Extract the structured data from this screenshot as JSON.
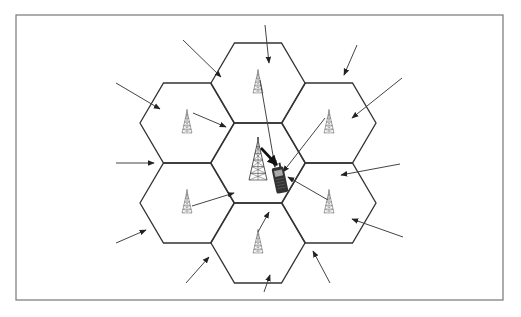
{
  "diagram": {
    "type": "cellular-network-cochannel-interference",
    "frame": {
      "x": 16,
      "y": 15,
      "width": 487,
      "height": 285,
      "stroke": "#777777"
    },
    "colors": {
      "hex_stroke": "#333333",
      "arrow": "#444444",
      "tower": "#555555",
      "phone": "#333333",
      "background": "#ffffff"
    },
    "cells": [
      {
        "id": "center",
        "cx": 258,
        "cy": 163,
        "has_tower": true,
        "tower_size": "large"
      },
      {
        "id": "top",
        "cx": 258,
        "cy": 83,
        "has_tower": true,
        "tower_size": "small"
      },
      {
        "id": "upper-left",
        "cx": 187,
        "cy": 123,
        "has_tower": true,
        "tower_size": "small"
      },
      {
        "id": "upper-right",
        "cx": 329,
        "cy": 123,
        "has_tower": true,
        "tower_size": "small"
      },
      {
        "id": "lower-left",
        "cx": 187,
        "cy": 203,
        "has_tower": true,
        "tower_size": "small"
      },
      {
        "id": "lower-right",
        "cx": 329,
        "cy": 203,
        "has_tower": true,
        "tower_size": "small"
      },
      {
        "id": "bottom",
        "cx": 258,
        "cy": 243,
        "has_tower": true,
        "tower_size": "small"
      }
    ],
    "hex_radius": 47,
    "mobile_phone": {
      "x": 274,
      "y": 167,
      "width": 12,
      "height": 26
    },
    "serving_link": {
      "from": [
        261,
        148
      ],
      "to": [
        277,
        165
      ],
      "style": "bold"
    },
    "interference_arrows_to_phone": [
      {
        "from_cell": "top",
        "from": [
          260,
          80
        ],
        "to": [
          275,
          167
        ]
      },
      {
        "from_cell": "upper-left",
        "from": [
          193,
          113
        ],
        "to": [
          226,
          127
        ]
      },
      {
        "from_cell": "upper-right",
        "from": [
          325,
          118
        ],
        "to": [
          283,
          172
        ]
      },
      {
        "from_cell": "lower-left",
        "from": [
          192,
          206
        ],
        "to": [
          234,
          193
        ]
      },
      {
        "from_cell": "lower-right",
        "from": [
          328,
          200
        ],
        "to": [
          288,
          177
        ]
      },
      {
        "from_cell": "bottom",
        "from": [
          258,
          232
        ],
        "to": [
          269,
          212
        ]
      }
    ],
    "external_arrows": [
      {
        "from": [
          265,
          25
        ],
        "to": [
          269,
          63
        ]
      },
      {
        "from": [
          183,
          40
        ],
        "to": [
          221,
          77
        ]
      },
      {
        "from": [
          357,
          45
        ],
        "to": [
          344,
          75
        ]
      },
      {
        "from": [
          116,
          83
        ],
        "to": [
          160,
          109
        ]
      },
      {
        "from": [
          402,
          78
        ],
        "to": [
          352,
          118
        ]
      },
      {
        "from": [
          116,
          163
        ],
        "to": [
          154,
          163
        ]
      },
      {
        "from": [
          400,
          164
        ],
        "to": [
          341,
          175
        ]
      },
      {
        "from": [
          116,
          243
        ],
        "to": [
          146,
          230
        ]
      },
      {
        "from": [
          403,
          237
        ],
        "to": [
          352,
          219
        ]
      },
      {
        "from": [
          186,
          283
        ],
        "to": [
          209,
          257
        ]
      },
      {
        "from": [
          264,
          292
        ],
        "to": [
          270,
          275
        ]
      },
      {
        "from": [
          330,
          283
        ],
        "to": [
          313,
          251
        ]
      }
    ]
  }
}
